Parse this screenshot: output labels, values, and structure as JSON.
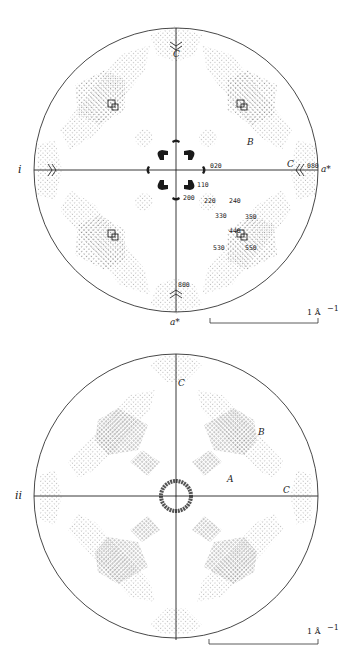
{
  "figure": {
    "panels": [
      {
        "id": "i",
        "panel_label": "i",
        "center": [
          176,
          170
        ],
        "radius": 142,
        "region_labels": {
          "top_C": "C",
          "right_C": "C",
          "B": "B",
          "a_star_right": "a*",
          "a_star_bottom": "a*"
        },
        "reflection_labels": [
          {
            "text": "020",
            "x": 210,
            "y": 168
          },
          {
            "text": "080",
            "x": 308,
            "y": 168
          },
          {
            "text": "110",
            "x": 197,
            "y": 187
          },
          {
            "text": "200",
            "x": 183,
            "y": 199
          },
          {
            "text": "220",
            "x": 205,
            "y": 202
          },
          {
            "text": "240",
            "x": 229,
            "y": 202
          },
          {
            "text": "330",
            "x": 216,
            "y": 218
          },
          {
            "text": "350",
            "x": 245,
            "y": 219
          },
          {
            "text": "440",
            "x": 229,
            "y": 233
          },
          {
            "text": "530",
            "x": 213,
            "y": 250
          },
          {
            "text": "550",
            "x": 245,
            "y": 250
          },
          {
            "text": "800",
            "x": 178,
            "y": 286
          }
        ],
        "scale_bar": {
          "label": "1 Å",
          "exponent": "−1",
          "x1": 210,
          "x2": 318,
          "y": 323
        }
      },
      {
        "id": "ii",
        "panel_label": "ii",
        "center": [
          176,
          496
        ],
        "radius": 142,
        "region_labels": {
          "top_C": "C",
          "right_C": "C",
          "A": "A",
          "B": "B"
        },
        "scale_bar": {
          "label": "1 Å",
          "exponent": "−1",
          "x1": 209,
          "x2": 318,
          "y": 644
        }
      }
    ]
  }
}
